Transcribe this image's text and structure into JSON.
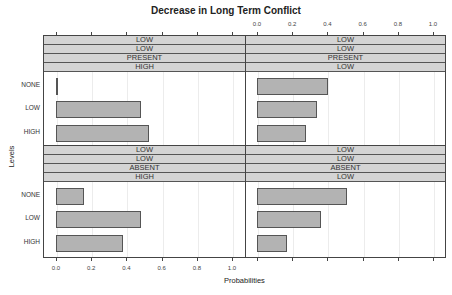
{
  "chart_data": {
    "type": "bar",
    "orientation": "horizontal",
    "title": "Decrease in Long Term Conflict",
    "xlabel": "Probabilities",
    "ylabel": "Levels",
    "xlim": [
      0.0,
      1.0
    ],
    "x_ticks": [
      "0.0",
      "0.2",
      "0.4",
      "0.6",
      "0.8",
      "1.0"
    ],
    "categories": [
      "NONE",
      "LOW",
      "HIGH"
    ],
    "grid": true,
    "panels": [
      {
        "position": "top-left",
        "strip_labels": [
          "LOW",
          "LOW",
          "PRESENT",
          "HIGH"
        ],
        "values": [
          0.005,
          0.48,
          0.52
        ]
      },
      {
        "position": "top-right",
        "strip_labels": [
          "LOW",
          "LOW",
          "PRESENT",
          "LOW"
        ],
        "values": [
          0.4,
          0.335,
          0.27
        ]
      },
      {
        "position": "bottom-left",
        "strip_labels": [
          "LOW",
          "LOW",
          "ABSENT",
          "HIGH"
        ],
        "values": [
          0.155,
          0.48,
          0.375
        ]
      },
      {
        "position": "bottom-right",
        "strip_labels": [
          "LOW",
          "LOW",
          "ABSENT",
          "LOW"
        ],
        "values": [
          0.505,
          0.36,
          0.165
        ]
      }
    ]
  },
  "colors": {
    "bar_fill": "#b3b3b3",
    "strip_fill": "#d4d4d4",
    "frame": "#444444"
  }
}
